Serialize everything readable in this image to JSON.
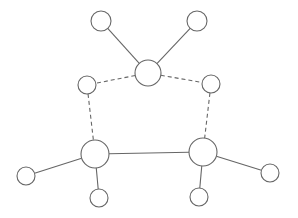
{
  "diagram": {
    "type": "graph",
    "width": 298,
    "height": 218,
    "colors": {
      "background": "#ffffff",
      "stroke": "#666666",
      "node_fill": "#ffffff"
    },
    "nodes": [
      {
        "id": "top-left-leaf",
        "x": 101,
        "y": 21,
        "r": 10
      },
      {
        "id": "top-right-leaf",
        "x": 197,
        "y": 21,
        "r": 10
      },
      {
        "id": "center-hub",
        "x": 148,
        "y": 73,
        "r": 13
      },
      {
        "id": "left-mid",
        "x": 87,
        "y": 85,
        "r": 9
      },
      {
        "id": "right-mid",
        "x": 211,
        "y": 84,
        "r": 9
      },
      {
        "id": "bottom-left-hub",
        "x": 95,
        "y": 154,
        "r": 14
      },
      {
        "id": "bottom-right-hub",
        "x": 203,
        "y": 152,
        "r": 14
      },
      {
        "id": "far-left-leaf",
        "x": 26,
        "y": 176,
        "r": 9
      },
      {
        "id": "bottom-left-leaf",
        "x": 99,
        "y": 198,
        "r": 9
      },
      {
        "id": "bottom-right-leaf",
        "x": 199,
        "y": 197,
        "r": 9
      },
      {
        "id": "far-right-leaf",
        "x": 270,
        "y": 173,
        "r": 9
      }
    ],
    "edges": [
      {
        "from": "top-left-leaf",
        "to": "center-hub",
        "style": "solid"
      },
      {
        "from": "top-right-leaf",
        "to": "center-hub",
        "style": "solid"
      },
      {
        "from": "center-hub",
        "to": "left-mid",
        "style": "dashed"
      },
      {
        "from": "center-hub",
        "to": "right-mid",
        "style": "dashed"
      },
      {
        "from": "left-mid",
        "to": "bottom-left-hub",
        "style": "dashed"
      },
      {
        "from": "right-mid",
        "to": "bottom-right-hub",
        "style": "dashed"
      },
      {
        "from": "bottom-left-hub",
        "to": "bottom-right-hub",
        "style": "solid"
      },
      {
        "from": "bottom-left-hub",
        "to": "far-left-leaf",
        "style": "solid"
      },
      {
        "from": "bottom-left-hub",
        "to": "bottom-left-leaf",
        "style": "solid"
      },
      {
        "from": "bottom-right-hub",
        "to": "bottom-right-leaf",
        "style": "solid"
      },
      {
        "from": "bottom-right-hub",
        "to": "far-right-leaf",
        "style": "solid"
      }
    ]
  }
}
